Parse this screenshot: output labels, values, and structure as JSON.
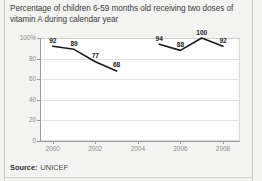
{
  "title": "Percentage of children 6-59 months old receiving two doses of vitamin A during calendar year",
  "source": {
    "label": "Source:",
    "value": "UNICEF"
  },
  "colors": {
    "background": "#f3f3f1",
    "plot_background": "#ffffff",
    "line": "#1a1a1a",
    "gridline": "#e3e3e0",
    "axis": "#9a9a97",
    "tick_text": "#8d8d8a",
    "label_text": "#222222"
  },
  "chart_data": {
    "type": "line",
    "title": "Percentage of children 6-59 months old receiving two doses of vitamin A during calendar year",
    "xlabel": "",
    "ylabel": "",
    "ylim": [
      0,
      100
    ],
    "xlim": [
      1999.4,
      2008.8
    ],
    "grid": true,
    "legend": "none",
    "ytick_labels": [
      "100%",
      "80",
      "60",
      "40",
      "20",
      "0"
    ],
    "ytick_values": [
      100,
      80,
      60,
      40,
      20,
      0
    ],
    "xtick_labels": [
      "2000",
      "2002",
      "2004",
      "2006",
      "2008"
    ],
    "xtick_values": [
      2000,
      2002,
      2004,
      2006,
      2008
    ],
    "series": [
      {
        "name": "first-period",
        "x": [
          2000,
          2001,
          2002,
          2003
        ],
        "values": [
          92,
          89,
          77,
          68
        ],
        "labels": [
          "92",
          "89",
          "77",
          "68"
        ]
      },
      {
        "name": "second-period",
        "x": [
          2005,
          2006,
          2007,
          2008
        ],
        "values": [
          94,
          88,
          100,
          92
        ],
        "labels": [
          "94",
          "88",
          "100",
          "92"
        ]
      }
    ]
  }
}
